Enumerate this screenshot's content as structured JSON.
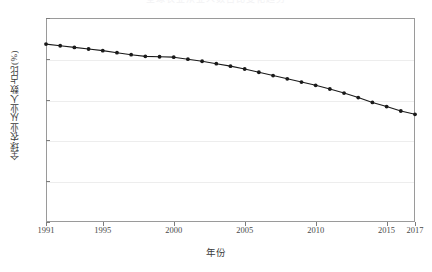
{
  "chart_data": {
    "type": "line",
    "title": "全球农业从业人数占比变化趋势",
    "xlabel": "年份",
    "ylabel": "全球农业从业人数占比(%)",
    "xlim": [
      1991,
      2017
    ],
    "ylim": [
      0,
      50
    ],
    "ytick_labels": [
      "0",
      "10",
      "20",
      "30",
      "40",
      "50"
    ],
    "ytick_values": [
      0,
      10,
      20,
      30,
      40,
      50
    ],
    "xtick_labels": [
      "1991",
      "1995",
      "2000",
      "2005",
      "2010",
      "2015",
      "2017"
    ],
    "xtick_values": [
      1991,
      1995,
      2000,
      2005,
      2010,
      2015,
      2017
    ],
    "grid": true,
    "legend": null,
    "marker": "filled-circle",
    "line_color": "#1a1a1a",
    "marker_color": "#1a1a1a",
    "x": [
      1991,
      1992,
      1993,
      1994,
      1995,
      1996,
      1997,
      1998,
      1999,
      2000,
      2001,
      2002,
      2003,
      2004,
      2005,
      2006,
      2007,
      2008,
      2009,
      2010,
      2011,
      2012,
      2013,
      2014,
      2015,
      2016,
      2017
    ],
    "values": [
      43.6,
      43.2,
      42.8,
      42.4,
      42.0,
      41.5,
      41.0,
      40.6,
      40.5,
      40.4,
      39.9,
      39.4,
      38.8,
      38.2,
      37.5,
      36.7,
      35.9,
      35.1,
      34.3,
      33.5,
      32.6,
      31.6,
      30.5,
      29.3,
      28.3,
      27.2,
      26.4
    ],
    "series_name": "全球农业从业人数占比"
  },
  "axes": {
    "y_ticks": [
      {
        "label": "50",
        "value": 50
      },
      {
        "label": "40",
        "value": 40
      },
      {
        "label": "30",
        "value": 30
      },
      {
        "label": "20",
        "value": 20
      },
      {
        "label": "10",
        "value": 10
      },
      {
        "label": "0",
        "value": 0
      }
    ],
    "x_ticks": [
      {
        "label": "1991",
        "value": 1991
      },
      {
        "label": "1995",
        "value": 1995
      },
      {
        "label": "2000",
        "value": 2000
      },
      {
        "label": "2005",
        "value": 2005
      },
      {
        "label": "2010",
        "value": 2010
      },
      {
        "label": "2015",
        "value": 2015
      },
      {
        "label": "2017",
        "value": 2017
      }
    ]
  }
}
